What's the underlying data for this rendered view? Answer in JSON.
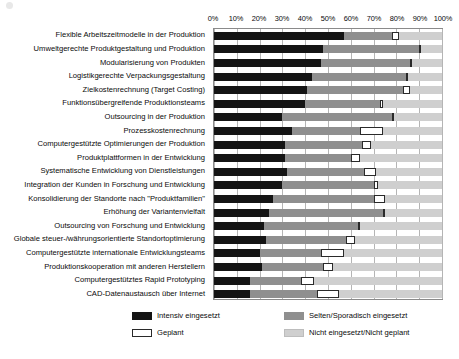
{
  "chart_data": {
    "type": "bar",
    "orientation": "horizontal",
    "stacked": true,
    "normalized_percent": true,
    "title": "",
    "subtitle": "",
    "xlabel": "",
    "ylabel": "",
    "xlim": [
      0,
      100
    ],
    "xticks": [
      "0%",
      "10%",
      "20%",
      "30%",
      "40%",
      "50%",
      "60%",
      "70%",
      "80%",
      "90%",
      "100%"
    ],
    "xtick_values": [
      0,
      10,
      20,
      30,
      40,
      50,
      60,
      70,
      80,
      90,
      100
    ],
    "grid": true,
    "grid_axis": "x",
    "legend_position": "bottom",
    "categories": [
      "Flexible Arbeitszeitmodelle in der Produktion",
      "Umweltgerechte Produktgestaltung und Produktion",
      "Modularisierung von Produkten",
      "Logistikgerechte Verpackungsgestaltung",
      "Zielkostenrechnung (Target Costing)",
      "Funktionsübergreifende Produktionsteams",
      "Outsourcing in der Produktion",
      "Prozesskostenrechnung",
      "Computergestützte Optimierungen der Produktion",
      "Produktplattformen in der Entwicklung",
      "Systematische Entwicklung von Dienstleistungen",
      "Integration der Kunden in Forschung und Entwicklung",
      "Konsolidierung der Standorte nach \"Produktfamilien\"",
      "Erhöhung der Variantenvielfalt",
      "Outsourcing von Forschung und Entwicklung",
      "Globale steuer-/währungsorientierte Standortoptimierung",
      "Computergestützte internationale Entwicklungsteams",
      "Produktionskooperation mit anderen Herstellern",
      "Computergestütztes Rapid Prototyping",
      "CAD-Datenaustausch über Internet"
    ],
    "series": [
      {
        "name": "Intensiv eingesetzt",
        "color": "#141414",
        "values": [
          57,
          48,
          47,
          43,
          41,
          40,
          30,
          34,
          31,
          31,
          32,
          30,
          26,
          24,
          22,
          23,
          20,
          21,
          16,
          16
        ]
      },
      {
        "name": "Selten/Sporadisch eingesetzt",
        "color": "#8f8f8f",
        "values": [
          21,
          42,
          39,
          41,
          42,
          33,
          48,
          30,
          34,
          29,
          34,
          40,
          44,
          50,
          41,
          35,
          27,
          27,
          22,
          29
        ]
      },
      {
        "name": "Geplant",
        "color": "#ffffff",
        "values": [
          3,
          1,
          1,
          1,
          3,
          1,
          1,
          10,
          4,
          4,
          5,
          2,
          5,
          1,
          1,
          4,
          10,
          4,
          6,
          10
        ]
      },
      {
        "name": "Nicht eingesetzt/Nicht geplant",
        "color": "#cfcfcf",
        "values": [
          19,
          9,
          13,
          15,
          14,
          26,
          21,
          26,
          31,
          36,
          29,
          28,
          25,
          25,
          36,
          38,
          43,
          48,
          56,
          45
        ]
      }
    ]
  },
  "axis": {
    "ticks": [
      "0%",
      "10%",
      "20%",
      "30%",
      "40%",
      "50%",
      "60%",
      "70%",
      "80%",
      "90%",
      "100%"
    ]
  },
  "legend": {
    "items": [
      {
        "label": "Intensiv eingesetzt",
        "swatch": "swatch-intensiv"
      },
      {
        "label": "Selten/Sporadisch eingesetzt",
        "swatch": "swatch-selten"
      },
      {
        "label": "Geplant",
        "swatch": "swatch-geplant"
      },
      {
        "label": "Nicht eingesetzt/Nicht geplant",
        "swatch": "swatch-nicht"
      }
    ]
  }
}
